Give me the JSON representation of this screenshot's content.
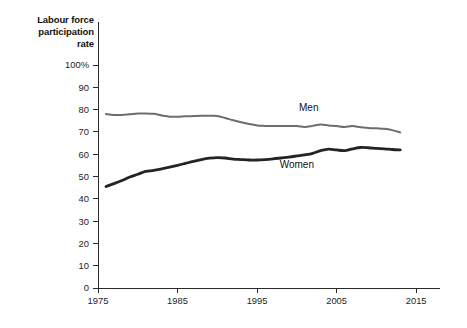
{
  "chart_data": {
    "type": "line",
    "title": "Labour force\nparticipation\nrate",
    "xlabel": "",
    "ylabel": "",
    "xlim": [
      1975,
      2018
    ],
    "ylim": [
      0,
      100
    ],
    "grid": false,
    "legend_position": "inline-annotation",
    "x_ticks": [
      "1975",
      "1985",
      "1995",
      "2005",
      "2015"
    ],
    "x_tick_values": [
      1975,
      1985,
      1995,
      2005,
      2015
    ],
    "y_ticks": [
      "0",
      "10",
      "20",
      "30",
      "40",
      "50",
      "60",
      "70",
      "80",
      "90",
      "100%"
    ],
    "y_tick_values": [
      0,
      10,
      20,
      30,
      40,
      50,
      60,
      70,
      80,
      90,
      100
    ],
    "annotations": [
      {
        "text": "Men",
        "x": 2001.5,
        "y": 79.5
      },
      {
        "text": "Women",
        "x": 2000.0,
        "y": 54.0
      }
    ],
    "x": [
      1976,
      1977,
      1978,
      1979,
      1980,
      1981,
      1982,
      1983,
      1984,
      1985,
      1986,
      1987,
      1988,
      1989,
      1990,
      1991,
      1992,
      1993,
      1994,
      1995,
      1996,
      1997,
      1998,
      1999,
      2000,
      2001,
      2002,
      2003,
      2004,
      2005,
      2006,
      2007,
      2008,
      2009,
      2010,
      2011,
      2012,
      2013
    ],
    "series": [
      {
        "name": "Men",
        "color": "#6d6d6d",
        "line_width": 2.0,
        "values": [
          78.0,
          77.6,
          77.6,
          77.9,
          78.2,
          78.3,
          78.1,
          77.4,
          76.8,
          76.8,
          77.0,
          77.1,
          77.2,
          77.2,
          77.1,
          76.2,
          75.2,
          74.3,
          73.5,
          72.9,
          72.7,
          72.6,
          72.6,
          72.6,
          72.6,
          72.2,
          72.7,
          73.3,
          72.9,
          72.6,
          72.2,
          72.6,
          72.1,
          71.8,
          71.6,
          71.4,
          70.8,
          69.8
        ]
      },
      {
        "name": "Women",
        "color": "#242424",
        "line_width": 2.8,
        "values": [
          45.5,
          46.8,
          48.2,
          49.8,
          51.0,
          52.3,
          52.7,
          53.4,
          54.2,
          55.0,
          55.9,
          56.8,
          57.6,
          58.2,
          58.5,
          58.3,
          57.8,
          57.6,
          57.4,
          57.4,
          57.6,
          57.9,
          58.3,
          58.7,
          59.2,
          59.7,
          60.4,
          61.6,
          62.3,
          61.9,
          61.6,
          62.4,
          63.0,
          62.9,
          62.6,
          62.4,
          62.1,
          61.9
        ]
      }
    ]
  }
}
